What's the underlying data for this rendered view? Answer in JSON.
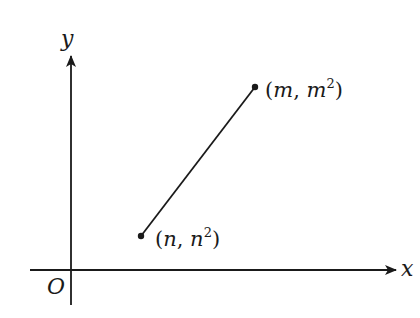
{
  "diagram": {
    "type": "coordinate-plane",
    "colors": {
      "background": "#ffffff",
      "ink": "#1a1a1a"
    },
    "axes": {
      "x_label": "x",
      "y_label": "y",
      "origin_label": "O"
    },
    "points": [
      {
        "id": "n",
        "label_open": "(",
        "var": "n",
        "sep": ", ",
        "sq_var": "n",
        "sup": "2",
        "label_close": ")"
      },
      {
        "id": "m",
        "label_open": "(",
        "var": "m",
        "sep": ", ",
        "sq_var": "m",
        "sup": "2",
        "label_close": ")"
      }
    ],
    "segment": {
      "from": "n",
      "to": "m"
    }
  }
}
